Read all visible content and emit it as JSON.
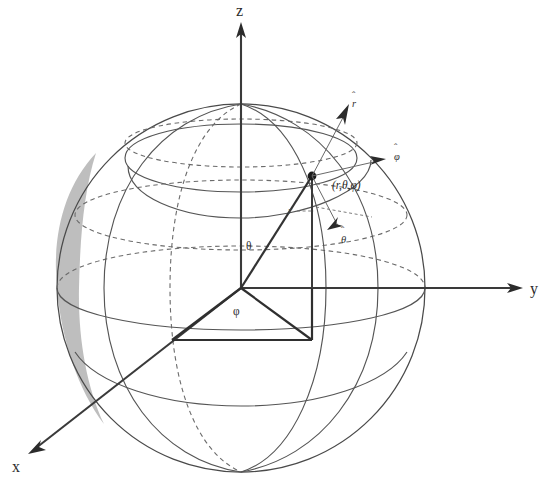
{
  "figure": {
    "background_color": "#ffffff",
    "line_color": "#4a4a4a",
    "shade_color": "#b8b8b8"
  },
  "axes": [
    {
      "id": "z",
      "label": "z",
      "direction": "up",
      "label_x": 236,
      "label_y": 16
    },
    {
      "id": "y",
      "label": "y",
      "direction": "right",
      "label_x": 530,
      "label_y": 294
    },
    {
      "id": "x",
      "label": "x",
      "direction": "down-left",
      "label_x": 12,
      "label_y": 472
    }
  ],
  "point": {
    "coord_label": "(r,θ,φ)",
    "coord_label_x": 332,
    "coord_label_y": 189,
    "x": 312,
    "y": 176
  },
  "angles": [
    {
      "id": "theta",
      "label": "θ",
      "x": 246,
      "y": 250
    },
    {
      "id": "phi",
      "label": "φ",
      "x": 235,
      "y": 315
    }
  ],
  "radius": {
    "label": "r",
    "label_x": 291,
    "label_y": 214
  },
  "unit_vectors": [
    {
      "id": "r-hat",
      "label": "r",
      "hat": "ˆ",
      "label_x": 353,
      "label_y": 104,
      "tip_x": 344,
      "tip_y": 112
    },
    {
      "id": "phi-hat",
      "label": "φ",
      "hat": "ˆ",
      "label_x": 396,
      "label_y": 157,
      "tip_x": 386,
      "tip_y": 160
    },
    {
      "id": "theta-hat",
      "label": "θ",
      "hat": "ˆ",
      "label_x": 342,
      "label_y": 240,
      "tip_x": 330,
      "tip_y": 232
    }
  ],
  "sphere": {
    "center_x": 241,
    "center_y": 288,
    "radius": 184
  }
}
